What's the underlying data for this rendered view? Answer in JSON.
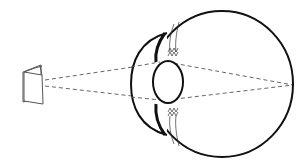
{
  "diagram": {
    "colors": {
      "background": "#ffffff",
      "stroke": "#111111",
      "ray": "#555555",
      "object_stroke": "#555555"
    },
    "elements": [
      {
        "id": "booklet",
        "label": "object (folded booklet)"
      },
      {
        "id": "light-rays",
        "label": "dashed light rays"
      },
      {
        "id": "cornea",
        "label": "cornea"
      },
      {
        "id": "iris",
        "label": "iris"
      },
      {
        "id": "lens",
        "label": "lens"
      },
      {
        "id": "ciliary-body",
        "label": "ciliary muscles / zonules"
      },
      {
        "id": "eyeball",
        "label": "eyeball (sclera)"
      },
      {
        "id": "focal-point",
        "label": "focal point on retina"
      }
    ]
  }
}
